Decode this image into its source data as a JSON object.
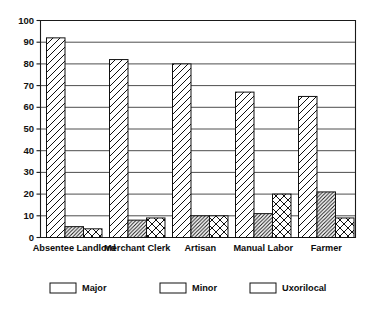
{
  "chart_data": {
    "type": "bar",
    "title": "",
    "subtitle": "",
    "xlabel": "",
    "ylabel": "",
    "ylim": [
      0,
      100
    ],
    "ytick_step": 10,
    "yticks": [
      0,
      10,
      20,
      30,
      40,
      50,
      60,
      70,
      80,
      90,
      100
    ],
    "grid": true,
    "grid_axis": "y",
    "legend_position": "bottom",
    "categories": [
      "Absentee Landlord",
      "Merchant Clerk",
      "Artisan",
      "Manual Labor",
      "Farmer"
    ],
    "series": [
      {
        "name": "Major",
        "pattern": "diagonal-wide",
        "values": [
          92,
          82,
          80,
          67,
          65
        ]
      },
      {
        "name": "Minor",
        "pattern": "diagonal-dense",
        "values": [
          5,
          8,
          10,
          11,
          21
        ]
      },
      {
        "name": "Uxorilocal",
        "pattern": "crosshatch",
        "values": [
          4,
          9,
          10,
          20,
          9
        ]
      }
    ],
    "colors": {
      "axis": "#1a1a1a",
      "grid": "#3a3a3a",
      "bar_outline": "#111111",
      "bar_fill": "#ffffff",
      "background": "#ffffff",
      "text": "#0d0d0d"
    }
  },
  "legend": {
    "items": [
      {
        "label": "Major",
        "swatch_name": "legend-swatch-major"
      },
      {
        "label": "Minor",
        "swatch_name": "legend-swatch-minor"
      },
      {
        "label": "Uxorilocal",
        "swatch_name": "legend-swatch-uxorilocal"
      }
    ]
  }
}
